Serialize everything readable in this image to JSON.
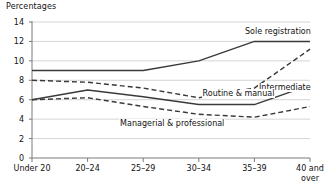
{
  "chart_data": {
    "type": "line",
    "title": "",
    "ylabel": "Percentages",
    "xlabel": "",
    "categories": [
      "Under 20",
      "20–24",
      "25–29",
      "30–34",
      "35–39",
      "40 and\nover"
    ],
    "ylim": [
      0,
      14
    ],
    "yticks": [
      0,
      2,
      4,
      6,
      8,
      10,
      12,
      14
    ],
    "ytick_labels": [
      "0",
      "2",
      "4",
      "6",
      "8",
      "10",
      "12",
      "14"
    ],
    "grid": "horizontal",
    "legend_position": "inline-labels",
    "series": [
      {
        "name": "Sole registration",
        "style": "solid",
        "color": "#3a3a3a",
        "values": [
          9.0,
          9.0,
          9.0,
          10.0,
          12.0,
          12.0
        ]
      },
      {
        "name": "Intermediate",
        "style": "dashed",
        "color": "#3a3a3a",
        "values": [
          8.0,
          7.8,
          7.2,
          6.2,
          7.2,
          11.2
        ]
      },
      {
        "name": "Routine & manual",
        "style": "solid",
        "color": "#3a3a3a",
        "values": [
          6.0,
          7.0,
          6.3,
          5.5,
          5.5,
          7.5
        ]
      },
      {
        "name": "Managerial & professional",
        "style": "dashed",
        "color": "#3a3a3a",
        "values": [
          6.0,
          6.2,
          5.3,
          4.5,
          4.2,
          5.3
        ]
      }
    ],
    "annotations": [
      {
        "text": "Sole registration",
        "x": 4.22,
        "y": 12.95
      },
      {
        "text": "Intermediate",
        "x": 5.05,
        "y": 7.25
      },
      {
        "text": "Routine & manual",
        "x": 3.05,
        "y": 6.6
      },
      {
        "text": "Managerial & professional",
        "x": 2.52,
        "y": 3.55
      }
    ]
  },
  "colors": {
    "axis": "#7a7a7a",
    "grid": "#c9c9c9",
    "line": "#3a3a3a",
    "text": "#111111",
    "background": "#ffffff"
  }
}
